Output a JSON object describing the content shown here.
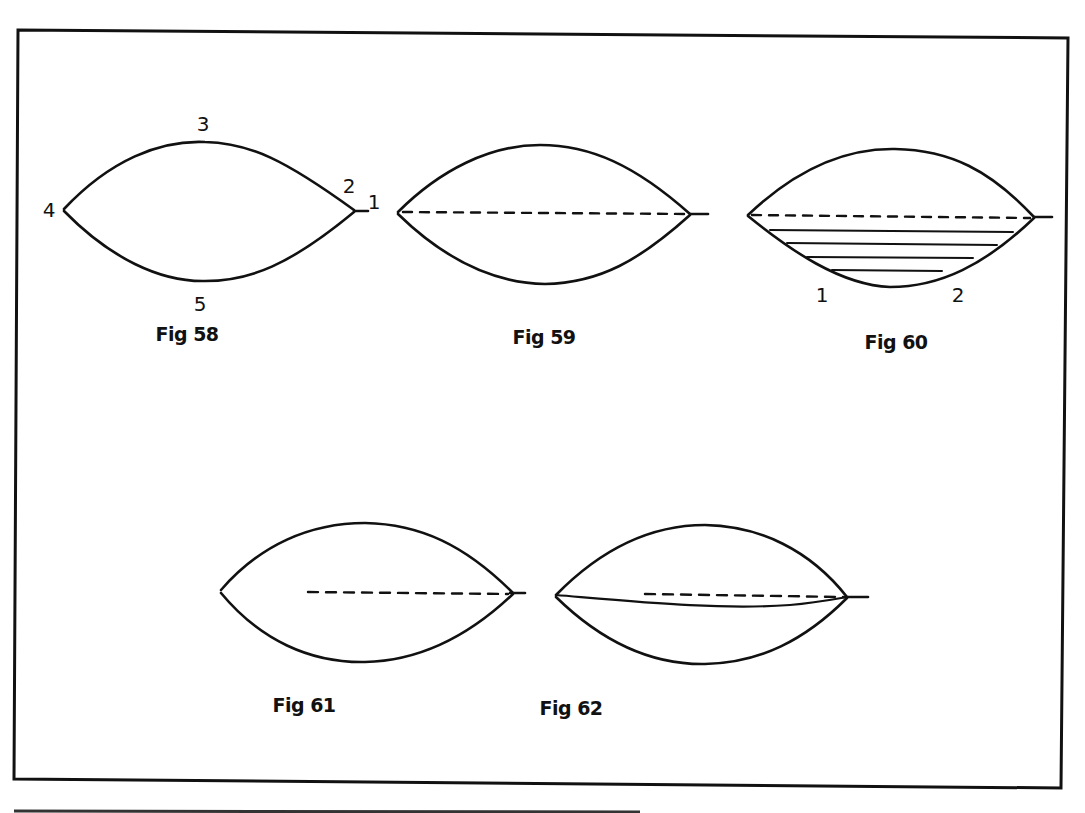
{
  "figures": [
    {
      "id": "fig58",
      "caption": "Fig 58",
      "labels": {
        "top": "3",
        "tip_upper": "2",
        "tip_right": "1",
        "left": "4",
        "bottom": "5"
      },
      "description": "Lens/leaf outline with numbered reference points"
    },
    {
      "id": "fig59",
      "caption": "Fig 59",
      "description": "Lens outline with dashed centerline from left tip to right tip"
    },
    {
      "id": "fig60",
      "caption": "Fig 60",
      "labels": {
        "lower_left": "1",
        "lower_right": "2"
      },
      "description": "Lens outline with dashed centerline and four horizontal hatch lines in lower half"
    },
    {
      "id": "fig61",
      "caption": "Fig 61",
      "description": "Lens outline with dashed line from center to right tip"
    },
    {
      "id": "fig62",
      "caption": "Fig 62",
      "description": "Lens outline with dashed line from center to right tip and a curved solid line from left tip to right tip"
    }
  ],
  "colors": {
    "ink": "#111111",
    "paper": "#ffffff"
  }
}
